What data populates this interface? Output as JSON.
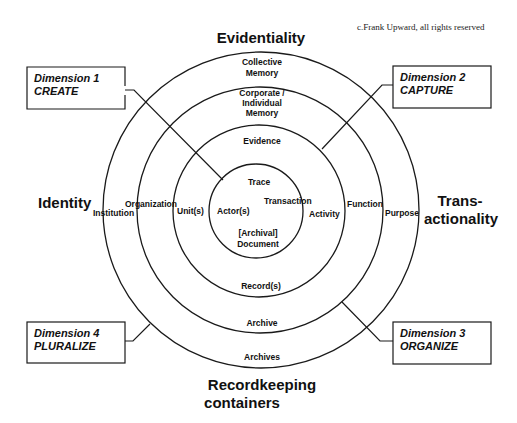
{
  "copyright": "c.Frank Upward, all rights reserved",
  "axes": {
    "top": "Evidentiality",
    "left": "Identity",
    "right_line1": "Trans-",
    "right_line2": "actionality",
    "bottom_line1": "Recordkeeping",
    "bottom_line2": "containers"
  },
  "rings": {
    "inner": {
      "top": "Trace",
      "left": "Actor(s)",
      "right": "Transaction",
      "bottom_line1": "[Archival]",
      "bottom_line2": "Document"
    },
    "second": {
      "top": "Evidence",
      "left": "Unit(s)",
      "right": "Activity",
      "bottom": "Record(s)"
    },
    "third": {
      "top_line1": "Corporate /",
      "top_line2": "Individual",
      "top_line3": "Memory",
      "left": "Organization",
      "right": "Function",
      "bottom": "Archive"
    },
    "outer": {
      "top_line1": "Collective",
      "top_line2": "Memory",
      "left": "Institution",
      "right": "Purpose",
      "bottom": "Archives"
    }
  },
  "dimensions": [
    {
      "title": "Dimension 1",
      "name": "CREATE"
    },
    {
      "title": "Dimension 2",
      "name": "CAPTURE"
    },
    {
      "title": "Dimension 3",
      "name": "ORGANIZE"
    },
    {
      "title": "Dimension 4",
      "name": "PLURALIZE"
    }
  ],
  "colors": {
    "stroke": "#1a1a1a",
    "text": "#111111",
    "background": "#ffffff"
  }
}
